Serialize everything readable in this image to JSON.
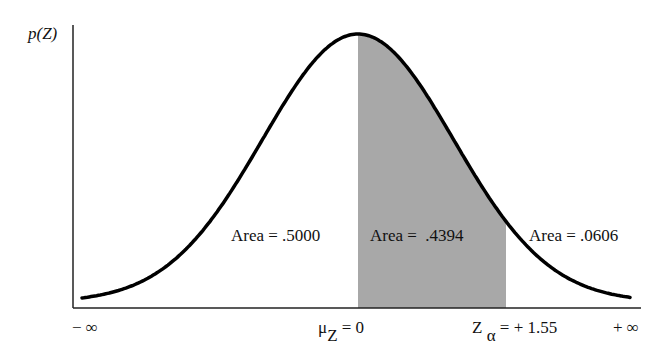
{
  "chart_data": {
    "type": "area",
    "title": "",
    "ylabel": "p(Z)",
    "xlabel": "",
    "distribution": "standard normal",
    "mean": 0,
    "shaded_interval": [
      0,
      1.55
    ],
    "xlim_labels": [
      "− ∞",
      "+ ∞"
    ],
    "tick_labels": [
      {
        "symbol": "μ",
        "subscript": "Z",
        "text": " = 0",
        "x": 0
      },
      {
        "symbol": "Z",
        "subscript": "α",
        "text": " = + 1.55",
        "x": 1.55
      }
    ],
    "regions": [
      {
        "label": "Area = .5000",
        "from": "-inf",
        "to": 0,
        "area": 0.5,
        "shaded": false
      },
      {
        "label": "Area =  .4394",
        "from": 0,
        "to": 1.55,
        "area": 0.4394,
        "shaded": true
      },
      {
        "label": "Area = .0606",
        "from": 1.55,
        "to": "+inf",
        "area": 0.0606,
        "shaded": false
      }
    ],
    "grid": false,
    "legend": "none"
  },
  "labels": {
    "y_axis": "p(Z)",
    "neg_inf": "− ∞",
    "pos_inf": "+ ∞",
    "mu_symbol": "μ",
    "mu_sub": "Z",
    "mu_value": " = 0",
    "z_symbol": "Z",
    "z_sub": "α",
    "z_value": " = + 1.55",
    "area_left": "Area = .5000",
    "area_mid": "Area =  .4394",
    "area_right": "Area = .0606"
  },
  "colors": {
    "shade": "#a8a8a8",
    "curve": "#000000",
    "axis": "#222222"
  }
}
